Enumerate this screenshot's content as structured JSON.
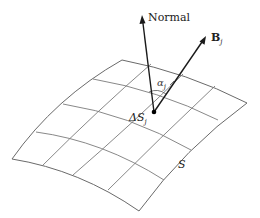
{
  "diagram": {
    "type": "surface-flux-illustration",
    "surface": {
      "label": "S",
      "grid_rows": 4,
      "grid_cols": 4,
      "corners": {
        "top_left": [
          122,
          60
        ],
        "top_right": [
          247,
          103
        ],
        "bottom_right": [
          139,
          211
        ],
        "bottom_left": [
          12,
          159
        ]
      },
      "stroke_color": "#7a7a7a"
    },
    "element": {
      "label_main": "ΔS",
      "label_sub": "j",
      "point": [
        154,
        112
      ]
    },
    "vectors": [
      {
        "name": "normal",
        "label": "Normal",
        "from": [
          154,
          112
        ],
        "to": [
          142,
          16
        ]
      },
      {
        "name": "b-vector",
        "label_main": "B",
        "label_sub": "j",
        "from": [
          154,
          112
        ],
        "to": [
          206,
          36
        ]
      }
    ],
    "angle": {
      "label_main": "α",
      "label_sub": "j"
    },
    "vector_color": "#1a1a1a"
  }
}
